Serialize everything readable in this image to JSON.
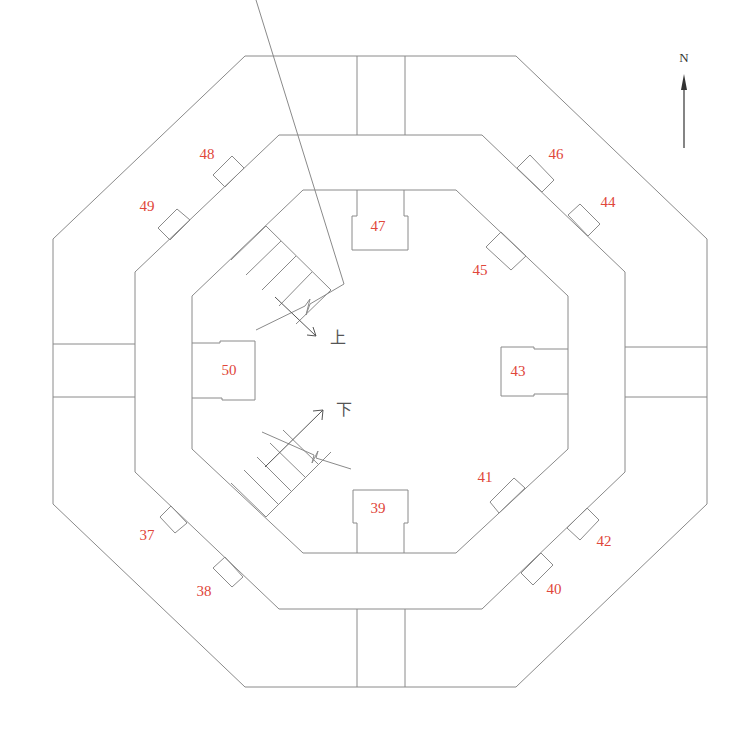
{
  "diagram": {
    "type": "octagonal floor plan",
    "compass": {
      "label": "N"
    },
    "stairs": {
      "up_label": "上",
      "down_label": "下"
    },
    "colors": {
      "wall": "#8a8a8a",
      "label": "#e0463a",
      "text": "#555555"
    },
    "rooms": [
      {
        "id": "47",
        "label": "47"
      },
      {
        "id": "50",
        "label": "50"
      },
      {
        "id": "43",
        "label": "43"
      },
      {
        "id": "39",
        "label": "39"
      }
    ],
    "niches": [
      {
        "id": "48",
        "label": "48"
      },
      {
        "id": "49",
        "label": "49"
      },
      {
        "id": "46",
        "label": "46"
      },
      {
        "id": "44",
        "label": "44"
      },
      {
        "id": "45",
        "label": "45"
      },
      {
        "id": "41",
        "label": "41"
      },
      {
        "id": "42",
        "label": "42"
      },
      {
        "id": "40",
        "label": "40"
      },
      {
        "id": "37",
        "label": "37"
      },
      {
        "id": "38",
        "label": "38"
      }
    ]
  }
}
